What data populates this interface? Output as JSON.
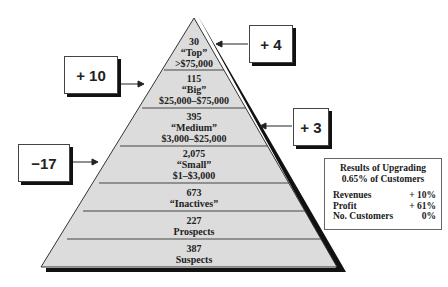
{
  "pyramid": {
    "tiers": [
      {
        "count": "30",
        "name": "“Top”",
        "range": ">$75,000"
      },
      {
        "count": "115",
        "name": "“Big”",
        "range": "$25,000–$75,000"
      },
      {
        "count": "395",
        "name": "“Medium”",
        "range": "$3,000–$25,000"
      },
      {
        "count": "2,075",
        "name": "“Small”",
        "range": "$1–$3,000"
      },
      {
        "count": "673",
        "name": "“Inactives”"
      },
      {
        "count": "227",
        "name": "Prospects"
      },
      {
        "count": "387",
        "name": "Suspects"
      }
    ],
    "fill_color": "#dcdcdc",
    "shadow_color": "#111111"
  },
  "callouts": {
    "top": "+ 4",
    "big": "+ 10",
    "medium": "+ 3",
    "small": "−17"
  },
  "results": {
    "title_line1": "Results of Upgrading",
    "title_line2": "0.65% of Customers",
    "rows": [
      {
        "label": "Revenues",
        "value": "+ 10%"
      },
      {
        "label": "Profit",
        "value": "+ 61%"
      },
      {
        "label": "No. Customers",
        "value": "0%"
      }
    ]
  }
}
